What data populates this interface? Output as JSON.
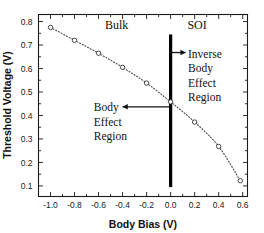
{
  "chart_data": {
    "type": "line",
    "title": "",
    "xlabel": "Body Bias (V)",
    "ylabel": "Threshold Voltage (V)",
    "xlim": [
      -1.1,
      0.64
    ],
    "ylim": [
      0.055,
      0.83
    ],
    "xticks": [
      -1.0,
      -0.8,
      -0.6,
      -0.4,
      -0.2,
      0.0,
      0.2,
      0.4,
      0.6
    ],
    "xticklabels": [
      "-1.0",
      "-0.8",
      "-0.6",
      "-0.4",
      "-0.2",
      "0.0",
      "0.2",
      "0.4",
      "0.6"
    ],
    "yticks": [
      0.1,
      0.2,
      0.3,
      0.4,
      0.5,
      0.6,
      0.7,
      0.8
    ],
    "yticklabels": [
      "0.1",
      "0.2",
      "0.3",
      "0.4",
      "0.5",
      "0.6",
      "0.7",
      "0.8"
    ],
    "grid": false,
    "legend": "none",
    "marker": "open-circle",
    "linestyle": "dotted",
    "series": [
      {
        "name": "Threshold Voltage vs Body Bias",
        "x": [
          -1.0,
          -0.8,
          -0.6,
          -0.4,
          -0.2,
          0.0,
          0.2,
          0.4,
          0.58
        ],
        "y": [
          0.775,
          0.72,
          0.665,
          0.605,
          0.538,
          0.458,
          0.372,
          0.268,
          0.122
        ]
      }
    ],
    "annotations": [
      {
        "text": "Bulk",
        "x": -0.45,
        "y": 0.805,
        "type": "region-label"
      },
      {
        "text": "SOI",
        "x": 0.22,
        "y": 0.805,
        "type": "region-label"
      },
      {
        "text": "Inverse",
        "x": 0.15,
        "y": 0.665,
        "type": "annotation-line"
      },
      {
        "text": "Body",
        "x": 0.15,
        "y": 0.605,
        "type": "annotation-line"
      },
      {
        "text": "Effect",
        "x": 0.15,
        "y": 0.545,
        "type": "annotation-line"
      },
      {
        "text": "Region",
        "x": 0.15,
        "y": 0.485,
        "type": "annotation-line"
      },
      {
        "text": "Body",
        "x": -0.62,
        "y": 0.435,
        "type": "annotation-line"
      },
      {
        "text": "Effect",
        "x": -0.62,
        "y": 0.375,
        "type": "annotation-line"
      },
      {
        "text": "Region",
        "x": -0.62,
        "y": 0.315,
        "type": "annotation-line"
      }
    ],
    "divider": {
      "x": 0.0,
      "y_from": 0.095,
      "y_to": 0.745,
      "color": "#000000"
    },
    "arrows": [
      {
        "name": "inverse-body-effect-arrow",
        "direction": "right",
        "from_x": 0.01,
        "to_x": 0.125,
        "y": 0.668
      },
      {
        "name": "body-effect-arrow",
        "direction": "left",
        "from_x": -0.01,
        "to_x": -0.4,
        "y": 0.437
      }
    ]
  },
  "axes": {
    "x_title": "Body Bias (V)",
    "y_title": "Threshold Voltage (V)"
  },
  "labels": {
    "bulk": "Bulk",
    "soi": "SOI",
    "inverse": "Inverse",
    "body_1": "Body",
    "effect_1": "Effect",
    "region_1": "Region",
    "body_2": "Body",
    "effect_2": "Effect",
    "region_2": "Region"
  },
  "colors": {
    "frame": "#1a1a1a",
    "curve": "#4a4a4a",
    "divider": "#000000",
    "text": "#111111",
    "background": "#ffffff"
  }
}
